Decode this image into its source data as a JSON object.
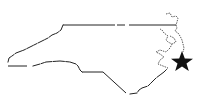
{
  "map": {
    "region": "North Carolina",
    "style": "state outline",
    "outline_color": "#222222",
    "marker": {
      "icon": "star-icon",
      "color": "#111111",
      "location_description": "Outer Banks, eastern coast",
      "center": [
        182,
        62
      ]
    }
  }
}
